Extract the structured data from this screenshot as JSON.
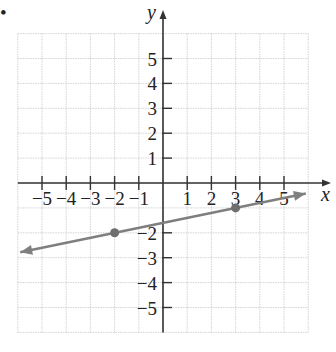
{
  "bullet": "•",
  "chart_data": {
    "type": "line",
    "title": "",
    "xlabel": "x",
    "ylabel": "y",
    "xlim": [
      -6,
      6
    ],
    "ylim": [
      -6,
      6
    ],
    "grid": true,
    "x_ticks": [
      -5,
      -4,
      -3,
      -2,
      -1,
      1,
      2,
      3,
      4,
      5
    ],
    "y_ticks": [
      5,
      4,
      3,
      2,
      1,
      -2,
      -3,
      -4,
      -5
    ],
    "x_tick_labels": [
      "−5",
      "−4",
      "−3",
      "−2",
      "−1",
      "1",
      "2",
      "3",
      "4",
      "5"
    ],
    "y_tick_labels": [
      "5",
      "4",
      "3",
      "2",
      "1",
      "−2",
      "−3",
      "−4",
      "−5"
    ],
    "series": [
      {
        "name": "line",
        "kind": "line-with-arrows",
        "slope": 0.2,
        "intercept": -1.6,
        "points": [
          {
            "x": -2,
            "y": -2
          },
          {
            "x": 3,
            "y": -1
          }
        ],
        "extent": {
          "x0": -5.9,
          "y0": -2.78,
          "x1": 5.9,
          "y1": -0.42
        },
        "color": "#7f7f7f"
      }
    ],
    "legend": null
  },
  "style": {
    "axis_color": "#333333",
    "grid_color": "#c8c8c8",
    "line_color": "#7f7f7f",
    "point_color": "#6e6e6e"
  }
}
